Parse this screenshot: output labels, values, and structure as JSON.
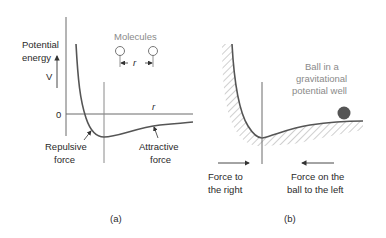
{
  "panel_a": {
    "caption": "(a)",
    "y_axis_label_line1": "Potential",
    "y_axis_label_line2": "energy",
    "y_symbol": "V",
    "zero_label": "0",
    "x_label": "r",
    "molecules_label": "Molecules",
    "separation_label": "r",
    "repulsive_line1": "Repulsive",
    "repulsive_line2": "force",
    "attractive_line1": "Attractive",
    "attractive_line2": "force"
  },
  "panel_b": {
    "caption": "(b)",
    "ball_label_line1": "Ball in a",
    "ball_label_line2": "gravitational",
    "ball_label_line3": "potential well",
    "left_force_line1": "Force  to",
    "left_force_line2": "the  right",
    "right_force_line1": "Force on the",
    "right_force_line2": "ball to the left"
  },
  "colors": {
    "curve": "#5a5a5a",
    "axis": "#6a6a6a",
    "text": "#2a2a2a",
    "label_gray": "#8a8a8a",
    "ball": "#555555",
    "hatch": "#9a9a9a"
  }
}
